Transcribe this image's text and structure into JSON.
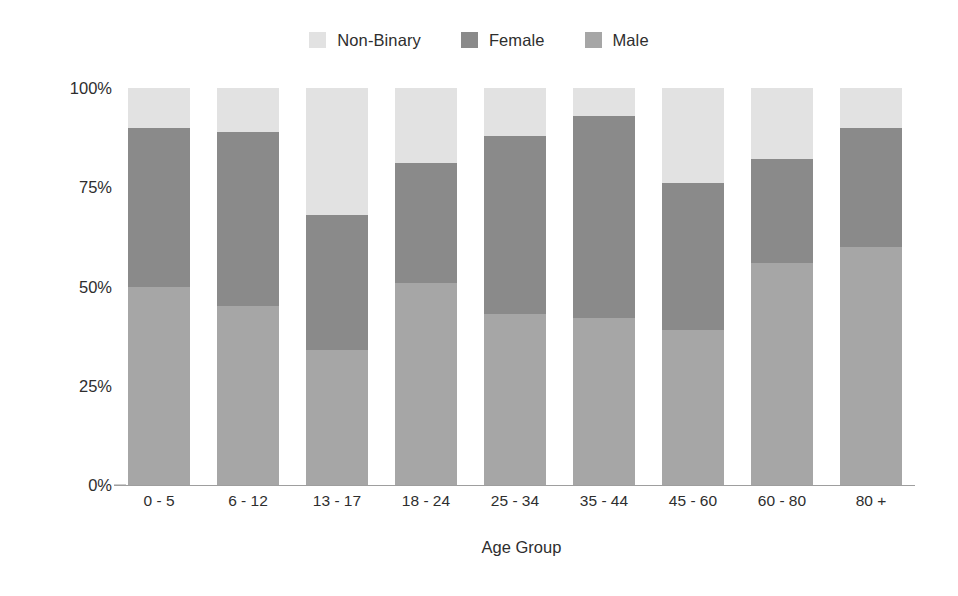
{
  "chart_data": {
    "type": "bar",
    "stacked": true,
    "stack_mode": "percent",
    "title": "",
    "subtitle": "",
    "xlabel": "Age Group",
    "ylabel": "",
    "categories": [
      "0 - 5",
      "6 - 12",
      "13 - 17",
      "18 - 24",
      "25 - 34",
      "35 - 44",
      "45 - 60",
      "60 - 80",
      "80 +"
    ],
    "series": [
      {
        "name": "Male",
        "color": "#a6a6a6",
        "values": [
          50,
          45,
          34,
          51,
          43,
          42,
          39,
          56,
          60
        ]
      },
      {
        "name": "Female",
        "color": "#8a8a8a",
        "values": [
          40,
          44,
          34,
          30,
          45,
          51,
          37,
          26,
          30
        ]
      },
      {
        "name": "Non-Binary",
        "color": "#e2e2e2",
        "values": [
          10,
          11,
          32,
          19,
          12,
          7,
          24,
          18,
          10
        ]
      }
    ],
    "stack_order_bottom_to_top": [
      "Male",
      "Female",
      "Non-Binary"
    ],
    "legend_order": [
      "Non-Binary",
      "Female",
      "Male"
    ],
    "legend_position": "top-center",
    "ylim": [
      0,
      100
    ],
    "yticks": [
      0,
      25,
      50,
      75,
      100
    ],
    "ytick_labels": [
      "0%",
      "25%",
      "50%",
      "75%",
      "100%"
    ],
    "grid": false,
    "axis_color": "#9e9e9e",
    "background": "#ffffff"
  },
  "legend": {
    "items": [
      {
        "label": "Non-Binary",
        "color": "#e2e2e2"
      },
      {
        "label": "Female",
        "color": "#8a8a8a"
      },
      {
        "label": "Male",
        "color": "#a6a6a6"
      }
    ]
  },
  "axes": {
    "x_title": "Age Group",
    "y_tick_labels": [
      "100%",
      "75%",
      "50%",
      "25%",
      "0%"
    ],
    "x_tick_labels": [
      "0 - 5",
      "6 - 12",
      "13 - 17",
      "18 - 24",
      "25 - 34",
      "35 - 44",
      "45 - 60",
      "60 - 80",
      "80 +"
    ]
  }
}
